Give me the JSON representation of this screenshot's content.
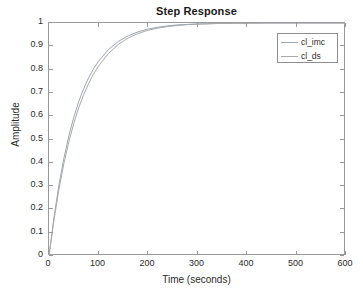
{
  "figure": {
    "background": "#ffffff",
    "axes_color": "#9a9a9a"
  },
  "chart_data": {
    "type": "line",
    "title": "Step Response",
    "xlabel": "Time (seconds)",
    "ylabel": "Amplitude",
    "xlim": [
      0,
      600
    ],
    "ylim": [
      0,
      1
    ],
    "xticks": [
      0,
      100,
      200,
      300,
      400,
      500,
      600
    ],
    "yticks": [
      0,
      0.1,
      0.2,
      0.3,
      0.4,
      0.5,
      0.6,
      0.7,
      0.8,
      0.9,
      1
    ],
    "xtick_labels": [
      "0",
      "100",
      "200",
      "300",
      "400",
      "500",
      "600"
    ],
    "ytick_labels": [
      "0",
      "0.1",
      "0.2",
      "0.3",
      "0.4",
      "0.5",
      "0.6",
      "0.7",
      "0.8",
      "0.9",
      "1"
    ],
    "grid": false,
    "legend_position": "top-right",
    "x": [
      0,
      10,
      20,
      30,
      40,
      50,
      60,
      70,
      80,
      90,
      100,
      120,
      140,
      160,
      180,
      200,
      220,
      240,
      260,
      280,
      300,
      320,
      340,
      360,
      380,
      400,
      420,
      440,
      460,
      480,
      500,
      520,
      540,
      560,
      580,
      600
    ],
    "series": [
      {
        "name": "cl_imc",
        "color": "#9aa7b8",
        "values": [
          0,
          0.165,
          0.304,
          0.419,
          0.515,
          0.595,
          0.662,
          0.718,
          0.765,
          0.804,
          0.836,
          0.886,
          0.921,
          0.945,
          0.962,
          0.974,
          0.982,
          0.988,
          0.992,
          0.994,
          0.996,
          0.997,
          0.998,
          0.999,
          0.999,
          0.999,
          1.0,
          1.0,
          1.0,
          1.0,
          1.0,
          1.0,
          1.0,
          1.0,
          1.0,
          1.0
        ]
      },
      {
        "name": "cl_ds",
        "color": "#a9a9a9",
        "values": [
          0,
          0.154,
          0.285,
          0.396,
          0.489,
          0.569,
          0.636,
          0.692,
          0.74,
          0.781,
          0.815,
          0.869,
          0.908,
          0.936,
          0.955,
          0.969,
          0.978,
          0.985,
          0.989,
          0.993,
          0.995,
          0.996,
          0.998,
          0.998,
          0.999,
          0.999,
          0.999,
          1.0,
          1.0,
          1.0,
          1.0,
          1.0,
          1.0,
          1.0,
          1.0,
          1.0
        ]
      }
    ]
  },
  "legend": {
    "entries": [
      {
        "label": "cl_imc",
        "color": "#9aa7b8"
      },
      {
        "label": "cl_ds",
        "color": "#a9a9a9"
      }
    ]
  }
}
